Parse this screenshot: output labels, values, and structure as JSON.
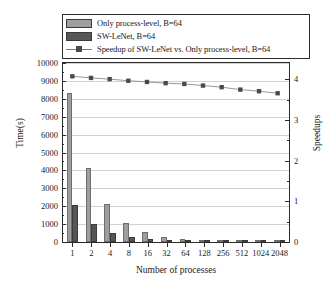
{
  "chart_data": {
    "type": "bar",
    "title": "",
    "xlabel": "Number of processes",
    "ylabel": "Time(s)",
    "ylabel_right": "Speedups",
    "categories": [
      "1",
      "2",
      "4",
      "8",
      "16",
      "32",
      "64",
      "128",
      "256",
      "512",
      "1024",
      "2048"
    ],
    "ylim": [
      0,
      10000
    ],
    "ylim_right": [
      0,
      4.4
    ],
    "yticks": [
      0,
      1000,
      2000,
      3000,
      4000,
      5000,
      6000,
      7000,
      8000,
      9000,
      10000
    ],
    "yticks_right": [
      0,
      1,
      2,
      3,
      4
    ],
    "grid": true,
    "legend_position": "top",
    "series": [
      {
        "name": "Only process-level, B=64",
        "type": "bar",
        "color": "#9e9e9e",
        "axis": "left",
        "values": [
          8350,
          4150,
          2120,
          1070,
          560,
          300,
          170,
          105,
          70,
          52,
          42,
          36
        ]
      },
      {
        "name": "SW-LeNet, B=64",
        "type": "bar",
        "color": "#565656",
        "axis": "left",
        "values": [
          2050,
          1030,
          530,
          270,
          142,
          78,
          45,
          28,
          19,
          14,
          11,
          10
        ]
      },
      {
        "name": "Speedup of SW-LeNet vs. Only process-level, B=64",
        "type": "line",
        "color": "#4a4a4a",
        "axis": "right",
        "values": [
          4.07,
          4.03,
          4.0,
          3.96,
          3.93,
          3.9,
          3.88,
          3.84,
          3.8,
          3.74,
          3.7,
          3.65
        ]
      }
    ]
  },
  "legend": {
    "items": [
      {
        "label": "Only process-level, B=64",
        "key": "swatch-light"
      },
      {
        "label": "SW-LeNet, B=64",
        "key": "swatch-dark"
      },
      {
        "label": "Speedup of SW-LeNet vs. Only process-level, B=64",
        "key": "line-marker"
      }
    ]
  }
}
